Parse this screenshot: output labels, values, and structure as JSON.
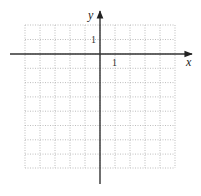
{
  "diagram": {
    "type": "coordinate-grid",
    "x_axis_label": "x",
    "y_axis_label": "y",
    "x_tick_label": "1",
    "y_tick_label": "1",
    "grid": {
      "columns": 10,
      "rows": 10,
      "x_range": [
        -5,
        5
      ],
      "y_range": [
        -8,
        2
      ],
      "line_style": "dotted"
    },
    "colors": {
      "axis": "#333333",
      "grid": "#b8b8b8"
    }
  }
}
